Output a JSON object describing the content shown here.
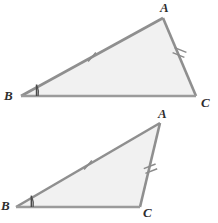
{
  "figure": {
    "background_color": "#ffffff",
    "fill_color": "#f1f1f1",
    "stroke_color": "#8f8f8f",
    "label_color": "#2e2e2e",
    "mark_color": "#8a8a8a",
    "angle_mark_color": "#4a4a4a"
  },
  "triangles": [
    {
      "id": "triangle-top",
      "vertices": {
        "A": {
          "label": "A",
          "x": 163,
          "y": 18,
          "label_x": 160,
          "label_y": 1
        },
        "B": {
          "label": "B",
          "x": 21,
          "y": 96,
          "label_x": 4,
          "label_y": 89
        },
        "C": {
          "label": "C",
          "x": 196,
          "y": 96,
          "label_x": 200,
          "label_y": 96
        }
      },
      "side_marks": [
        {
          "side": "AB",
          "ticks": 1,
          "position": 0.52
        },
        {
          "side": "AC",
          "ticks": 2,
          "position": 0.48
        }
      ],
      "angle_marks": [
        {
          "vertex": "B",
          "arcs": 1,
          "tick": true
        }
      ]
    },
    {
      "id": "triangle-bottom",
      "vertices": {
        "A": {
          "label": "A",
          "x": 160,
          "y": 123,
          "label_x": 158,
          "label_y": 107
        },
        "B": {
          "label": "B",
          "x": 16,
          "y": 207,
          "label_x": 1,
          "label_y": 199
        },
        "C": {
          "label": "C",
          "x": 140,
          "y": 207,
          "label_x": 143,
          "label_y": 206
        }
      },
      "side_marks": [
        {
          "side": "AB",
          "ticks": 1,
          "position": 0.52
        },
        {
          "side": "AC",
          "ticks": 2,
          "position": 0.5
        }
      ],
      "angle_marks": [
        {
          "vertex": "B",
          "arcs": 1,
          "tick": true
        }
      ]
    }
  ]
}
